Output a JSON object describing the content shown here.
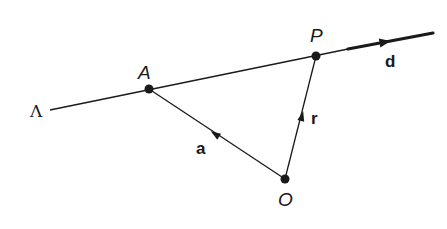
{
  "diagram": {
    "type": "vector-line-diagram",
    "line": {
      "label": "Λ",
      "start": [
        50,
        110
      ],
      "end": [
        348,
        49
      ]
    },
    "direction_vector": {
      "label": "d",
      "start": [
        348,
        49
      ],
      "end": [
        433,
        33
      ],
      "arrow_at": [
        385,
        42
      ]
    },
    "points": [
      {
        "id": "A",
        "label": "A",
        "x": 149,
        "y": 89,
        "label_x": 138,
        "label_y": 79
      },
      {
        "id": "P",
        "label": "P",
        "x": 316,
        "y": 56,
        "label_x": 310,
        "label_y": 42
      },
      {
        "id": "O",
        "label": "O",
        "x": 285,
        "y": 179,
        "label_x": 278,
        "label_y": 206
      }
    ],
    "vectors": [
      {
        "id": "a",
        "label": "a",
        "from": "O",
        "to": "A",
        "arrow_at": [
          215,
          134
        ],
        "label_x": 196,
        "label_y": 154
      },
      {
        "id": "r",
        "label": "r",
        "from": "O",
        "to": "P",
        "arrow_at": [
          302,
          116
        ],
        "label_x": 311,
        "label_y": 124
      }
    ],
    "colors": {
      "ink": "#1a1a1a",
      "background": "#ffffff"
    }
  }
}
